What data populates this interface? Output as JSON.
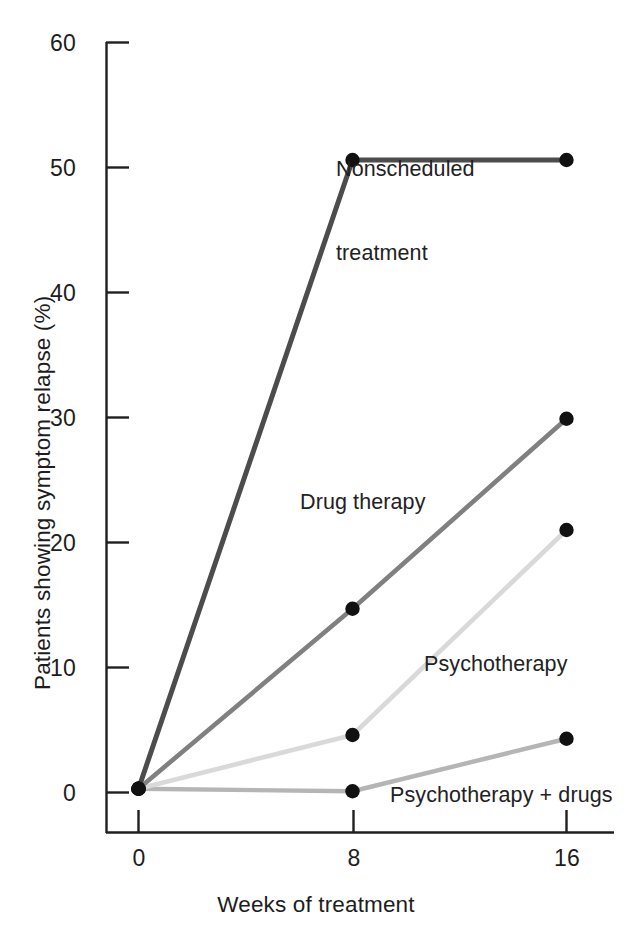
{
  "chart_data": {
    "type": "line",
    "title": "",
    "subtitle": "",
    "xlabel": "Weeks of treatment",
    "ylabel": "Patients showing symptom relapse (%)",
    "x": [
      0,
      8,
      16
    ],
    "xticks": [
      "0",
      "8",
      "16"
    ],
    "yticks": [
      "0",
      "10",
      "20",
      "30",
      "40",
      "50",
      "60"
    ],
    "xlim": [
      0,
      16
    ],
    "ylim": [
      0,
      60
    ],
    "grid": false,
    "legend_position": "inline-annotations",
    "markers": "filled-circle",
    "series": [
      {
        "name": "Nonscheduled treatment",
        "values": [
          0.3,
          50.6,
          50.6
        ],
        "color": "#4c4c4c",
        "width": 5.0
      },
      {
        "name": "Drug therapy",
        "values": [
          0.3,
          14.7,
          29.9
        ],
        "color": "#808080",
        "width": 4.6
      },
      {
        "name": "Psychotherapy",
        "values": [
          0.3,
          4.6,
          21.0
        ],
        "color": "#d9d9d9",
        "width": 4.6
      },
      {
        "name": "Psychotherapy + drugs",
        "values": [
          0.3,
          0.1,
          4.3
        ],
        "color": "#b5b5b5",
        "width": 4.4
      }
    ]
  },
  "axes": {
    "y_title": "Patients showing symptom relapse (%)",
    "x_title": "Weeks of treatment",
    "y_tick_0": "0",
    "y_tick_10": "10",
    "y_tick_20": "20",
    "y_tick_30": "30",
    "y_tick_40": "40",
    "y_tick_50": "50",
    "y_tick_60": "60",
    "x_tick_0": "0",
    "x_tick_8": "8",
    "x_tick_16": "16"
  },
  "annotations": {
    "nonscheduled_line1": "Nonscheduled",
    "nonscheduled_line2": "treatment",
    "drug_therapy": "Drug therapy",
    "psychotherapy": "Psychotherapy",
    "psychotherapy_drugs": "Psychotherapy + drugs"
  },
  "colors": {
    "axis": "#1f1f1f",
    "marker": "#111111",
    "background": "#ffffff"
  }
}
